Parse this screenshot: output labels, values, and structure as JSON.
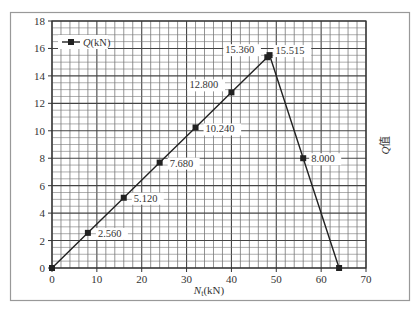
{
  "chart_data": {
    "type": "line",
    "title": "",
    "xlabel": "N_t(kN)",
    "xlabel_main": "N",
    "xlabel_sub": "t",
    "xlabel_unit": "(kN)",
    "ylabel": "Q值",
    "xlim": [
      0,
      70
    ],
    "ylim": [
      0,
      18
    ],
    "x_ticks": [
      0,
      10,
      20,
      30,
      40,
      50,
      60,
      70
    ],
    "y_ticks": [
      0,
      2,
      4,
      6,
      8,
      10,
      12,
      14,
      16,
      18
    ],
    "grid": true,
    "grid_minor_x_step": 2,
    "grid_minor_y_step": 0.5,
    "legend_position": "upper-left",
    "series": [
      {
        "name": "Q(kN)",
        "legend_label_italic": "Q",
        "legend_label_unit": "(kN)",
        "marker": "square",
        "color": "#222222",
        "x": [
          0,
          8,
          16,
          24,
          32,
          40,
          48,
          48.5,
          56,
          64
        ],
        "values": [
          0,
          2.56,
          5.12,
          7.68,
          10.24,
          12.8,
          15.36,
          15.515,
          8.0,
          0
        ]
      }
    ],
    "annotations": [
      {
        "text": "2.560",
        "x": 8,
        "y": 2.56,
        "dx": 10,
        "dy": 4
      },
      {
        "text": "5.120",
        "x": 16,
        "y": 5.12,
        "dx": 10,
        "dy": 4
      },
      {
        "text": "7.680",
        "x": 24,
        "y": 7.68,
        "dx": 10,
        "dy": 4
      },
      {
        "text": "10.240",
        "x": 32,
        "y": 10.24,
        "dx": 10,
        "dy": 5
      },
      {
        "text": "12.800",
        "x": 40,
        "y": 12.8,
        "dx": -42,
        "dy": -4
      },
      {
        "text": "15.360",
        "x": 48,
        "y": 15.36,
        "dx": -42,
        "dy": -4
      },
      {
        "text": "15.515",
        "x": 48.5,
        "y": 15.515,
        "dx": 6,
        "dy": -1
      },
      {
        "text": "8.000",
        "x": 56,
        "y": 8.0,
        "dx": 8,
        "dy": 4
      }
    ]
  }
}
